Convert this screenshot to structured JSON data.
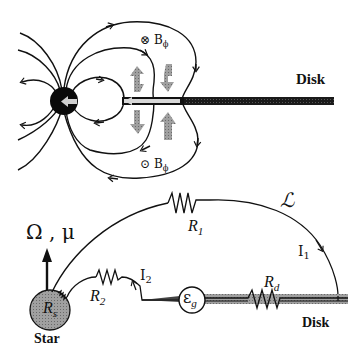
{
  "top_panel": {
    "disk_label": "Disk",
    "field_top_label": {
      "symbol": "⊗",
      "text": "B",
      "sub": "ϕ"
    },
    "field_bottom_label": {
      "symbol": "⊙",
      "text": "B",
      "sub": "ϕ"
    }
  },
  "bottom_panel": {
    "spin_label": "Ω , μ",
    "star_label": "Star",
    "disk_label": "Disk",
    "inductance_label": "ℒ",
    "resistors": {
      "r1": {
        "text": "R",
        "sub": "1"
      },
      "r2": {
        "text": "R",
        "sub": "2"
      },
      "rs": {
        "text": "R",
        "sub": "s"
      },
      "rd": {
        "text": "R",
        "sub": "d"
      }
    },
    "currents": {
      "i1": {
        "text": "I",
        "sub": "1"
      },
      "i2": {
        "text": "I",
        "sub": "2"
      }
    },
    "emf": {
      "text": "ε",
      "sub": "g"
    }
  },
  "colors": {
    "line": "#111111",
    "star_top": "#0a0a0a",
    "star_bottom": "#9a9a9a",
    "disk_bottom": "#a8a8a8",
    "arrow_gray": "#7a7a7a"
  }
}
